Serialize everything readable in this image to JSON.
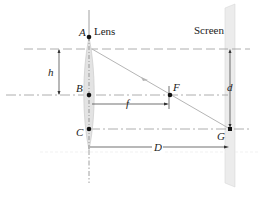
{
  "diagram": {
    "title_labels": {
      "lens": "Lens",
      "screen": "Screen"
    },
    "points": {
      "A": "A",
      "B": "B",
      "C": "C",
      "F": "F",
      "G": "G"
    },
    "dimensions": {
      "h": "h",
      "f": "f",
      "d": "d",
      "D": "D"
    },
    "colors": {
      "line": "#333333",
      "dashed": "#9a9a9a",
      "lens_fill": "#e3e3e3",
      "screen_fill": "#ececec",
      "ray": "#b5b5b5"
    }
  }
}
